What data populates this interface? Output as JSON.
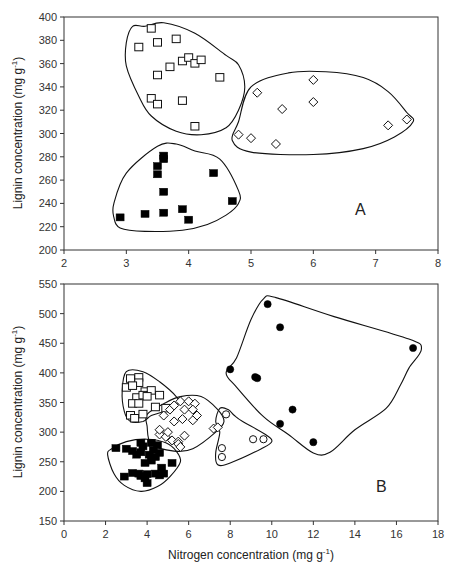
{
  "chart_data": [
    {
      "type": "scatter",
      "panel_label": "A",
      "title": "",
      "xlabel": "",
      "ylabel": "Lignin concentration (mg g",
      "ylabel_sup": "-1",
      "ylabel_suffix": ")",
      "xlim": [
        2,
        8
      ],
      "ylim": [
        200,
        400
      ],
      "xticks": [
        2,
        3,
        4,
        5,
        6,
        7,
        8
      ],
      "yticks": [
        200,
        220,
        240,
        260,
        280,
        300,
        320,
        340,
        360,
        380,
        400
      ],
      "grid": false,
      "legend": null,
      "series": [
        {
          "name": "open squares",
          "marker": "square-open",
          "points": [
            [
              3.2,
              374
            ],
            [
              3.4,
              390
            ],
            [
              3.5,
              378
            ],
            [
              3.8,
              381
            ],
            [
              3.7,
              357
            ],
            [
              3.9,
              362
            ],
            [
              4.0,
              365
            ],
            [
              4.1,
              360
            ],
            [
              4.2,
              363
            ],
            [
              3.5,
              350
            ],
            [
              4.5,
              348
            ],
            [
              3.4,
              330
            ],
            [
              3.5,
              325
            ],
            [
              3.9,
              328
            ],
            [
              4.1,
              306
            ]
          ],
          "hull": [
            [
              3.3,
              392
            ],
            [
              3.6,
              395
            ],
            [
              4.1,
              386
            ],
            [
              4.6,
              367
            ],
            [
              4.8,
              359
            ],
            [
              4.9,
              340
            ],
            [
              4.8,
              320
            ],
            [
              4.6,
              305
            ],
            [
              4.2,
              299
            ],
            [
              3.8,
              302
            ],
            [
              3.4,
              315
            ],
            [
              3.2,
              332
            ],
            [
              3.0,
              358
            ],
            [
              3.0,
              378
            ],
            [
              3.1,
              392
            ]
          ]
        },
        {
          "name": "open diamonds",
          "marker": "diamond-open",
          "points": [
            [
              5.1,
              335
            ],
            [
              6.0,
              346
            ],
            [
              6.0,
              327
            ],
            [
              5.5,
              321
            ],
            [
              4.8,
              299
            ],
            [
              5.0,
              296
            ],
            [
              5.4,
              291
            ],
            [
              7.2,
              307
            ],
            [
              7.5,
              312
            ]
          ],
          "hull": [
            [
              5.0,
              340
            ],
            [
              5.6,
              352
            ],
            [
              6.2,
              353
            ],
            [
              6.8,
              348
            ],
            [
              7.2,
              336
            ],
            [
              7.5,
              318
            ],
            [
              7.6,
              310
            ],
            [
              7.3,
              297
            ],
            [
              6.8,
              287
            ],
            [
              6.0,
              282
            ],
            [
              5.0,
              284
            ],
            [
              4.7,
              294
            ],
            [
              4.8,
              310
            ]
          ]
        },
        {
          "name": "filled squares",
          "marker": "square-filled",
          "points": [
            [
              2.9,
              228
            ],
            [
              3.3,
              231
            ],
            [
              3.6,
              281
            ],
            [
              3.6,
              278
            ],
            [
              3.5,
              272
            ],
            [
              3.5,
              265
            ],
            [
              3.6,
              250
            ],
            [
              3.6,
              232
            ],
            [
              3.9,
              235
            ],
            [
              4.0,
              226
            ],
            [
              4.4,
              266
            ],
            [
              4.7,
              242
            ]
          ],
          "hull": [
            [
              3.0,
              266
            ],
            [
              3.5,
              289
            ],
            [
              3.8,
              291
            ],
            [
              4.1,
              285
            ],
            [
              4.5,
              278
            ],
            [
              4.8,
              251
            ],
            [
              4.8,
              240
            ],
            [
              4.6,
              230
            ],
            [
              4.3,
              222
            ],
            [
              3.9,
              217
            ],
            [
              3.3,
              216
            ],
            [
              2.9,
              219
            ],
            [
              2.8,
              228
            ],
            [
              2.8,
              240
            ]
          ]
        }
      ],
      "annotations": [
        "A"
      ]
    },
    {
      "type": "scatter",
      "panel_label": "B",
      "title": "",
      "xlabel": "Nitrogen concentration (mg g",
      "xlabel_sup": "-1",
      "xlabel_suffix": ")",
      "ylabel": "Lignin concentration (mg g",
      "ylabel_sup": "-1",
      "ylabel_suffix": ")",
      "xlim": [
        0,
        18
      ],
      "ylim": [
        150,
        550
      ],
      "xticks": [
        0,
        2,
        4,
        6,
        8,
        10,
        12,
        14,
        16,
        18
      ],
      "yticks": [
        150,
        200,
        250,
        300,
        350,
        400,
        450,
        500,
        550
      ],
      "grid": false,
      "legend": null,
      "series": [
        {
          "name": "open squares",
          "marker": "square-open",
          "points": [
            [
              3.2,
              390
            ],
            [
              3.6,
              392
            ],
            [
              3.6,
              383
            ],
            [
              3.0,
              375
            ],
            [
              3.3,
              378
            ],
            [
              3.9,
              368
            ],
            [
              4.2,
              370
            ],
            [
              3.5,
              358
            ],
            [
              3.8,
              362
            ],
            [
              4.0,
              360
            ],
            [
              3.3,
              348
            ],
            [
              3.6,
              348
            ],
            [
              4.6,
              362
            ],
            [
              3.2,
              328
            ],
            [
              3.4,
              323
            ],
            [
              3.8,
              330
            ],
            [
              4.4,
              342
            ],
            [
              4.9,
              340
            ]
          ],
          "hull": [
            [
              3.0,
              402
            ],
            [
              3.8,
              402
            ],
            [
              4.6,
              385
            ],
            [
              5.4,
              360
            ],
            [
              5.5,
              348
            ],
            [
              4.8,
              335
            ],
            [
              4.2,
              328
            ],
            [
              3.8,
              318
            ],
            [
              3.2,
              318
            ],
            [
              2.9,
              335
            ],
            [
              2.8,
              370
            ]
          ]
        },
        {
          "name": "open diamonds",
          "marker": "diamond-open",
          "points": [
            [
              4.8,
              328
            ],
            [
              5.1,
              338
            ],
            [
              5.3,
              345
            ],
            [
              5.6,
              352
            ],
            [
              6.0,
              352
            ],
            [
              6.3,
              348
            ],
            [
              5.8,
              338
            ],
            [
              6.2,
              338
            ],
            [
              5.3,
              318
            ],
            [
              5.7,
              322
            ],
            [
              6.2,
              320
            ],
            [
              6.4,
              328
            ],
            [
              4.6,
              296
            ],
            [
              4.9,
              292
            ],
            [
              5.2,
              286
            ],
            [
              5.5,
              284
            ],
            [
              5.0,
              300
            ],
            [
              4.6,
              304
            ],
            [
              5.8,
              294
            ],
            [
              5.5,
              280
            ],
            [
              5.6,
              275
            ],
            [
              7.2,
              306
            ],
            [
              7.4,
              308
            ]
          ],
          "hull": [
            [
              4.0,
              330
            ],
            [
              4.8,
              348
            ],
            [
              5.6,
              360
            ],
            [
              6.6,
              360
            ],
            [
              7.4,
              338
            ],
            [
              7.7,
              318
            ],
            [
              7.3,
              300
            ],
            [
              6.2,
              272
            ],
            [
              5.3,
              268
            ],
            [
              4.2,
              280
            ],
            [
              4.0,
              310
            ]
          ]
        },
        {
          "name": "open circles",
          "marker": "circle-open",
          "points": [
            [
              7.8,
              330
            ],
            [
              7.6,
              273
            ],
            [
              7.6,
              258
            ],
            [
              9.1,
              288
            ],
            [
              9.6,
              288
            ]
          ],
          "hull": [
            [
              7.5,
              340
            ],
            [
              7.9,
              338
            ],
            [
              8.2,
              328
            ],
            [
              8.6,
              318
            ],
            [
              9.7,
              296
            ],
            [
              10.0,
              284
            ],
            [
              9.5,
              272
            ],
            [
              8.0,
              248
            ],
            [
              7.4,
              245
            ],
            [
              7.3,
              265
            ],
            [
              7.5,
              300
            ],
            [
              7.3,
              318
            ]
          ]
        },
        {
          "name": "filled squares",
          "marker": "square-filled",
          "points": [
            [
              2.5,
              273
            ],
            [
              3.0,
              272
            ],
            [
              3.3,
              268
            ],
            [
              3.5,
              262
            ],
            [
              3.7,
              282
            ],
            [
              3.8,
              276
            ],
            [
              3.7,
              266
            ],
            [
              4.1,
              262
            ],
            [
              4.3,
              270
            ],
            [
              4.4,
              258
            ],
            [
              4.2,
              252
            ],
            [
              3.9,
              248
            ],
            [
              4.6,
              265
            ],
            [
              4.5,
              278
            ],
            [
              4.2,
              282
            ],
            [
              5.2,
              248
            ],
            [
              4.7,
              240
            ],
            [
              3.6,
              230
            ],
            [
              3.3,
              231
            ],
            [
              2.9,
              225
            ],
            [
              3.7,
              226
            ],
            [
              4.0,
              229
            ],
            [
              3.9,
              222
            ],
            [
              4.0,
              214
            ],
            [
              4.4,
              230
            ],
            [
              4.8,
              230
            ],
            [
              4.6,
              227
            ]
          ],
          "hull": [
            [
              2.3,
              272
            ],
            [
              3.0,
              284
            ],
            [
              4.0,
              288
            ],
            [
              4.9,
              282
            ],
            [
              5.4,
              268
            ],
            [
              5.6,
              250
            ],
            [
              5.1,
              225
            ],
            [
              4.5,
              208
            ],
            [
              3.7,
              200
            ],
            [
              2.9,
              210
            ],
            [
              2.4,
              230
            ],
            [
              2.1,
              262
            ]
          ]
        },
        {
          "name": "filled circles",
          "marker": "circle-filled",
          "points": [
            [
              9.8,
              516
            ],
            [
              10.4,
              477
            ],
            [
              16.8,
              442
            ],
            [
              8.0,
              406
            ],
            [
              9.2,
              393
            ],
            [
              9.3,
              391
            ],
            [
              11.0,
              338
            ],
            [
              10.4,
              314
            ],
            [
              12.0,
              283
            ]
          ],
          "hull": [
            [
              9.6,
              525
            ],
            [
              10.2,
              527
            ],
            [
              13.0,
              495
            ],
            [
              16.6,
              457
            ],
            [
              17.2,
              440
            ],
            [
              16.6,
              408
            ],
            [
              16.2,
              380
            ],
            [
              15.5,
              340
            ],
            [
              14.0,
              304
            ],
            [
              12.8,
              266
            ],
            [
              12.0,
              265
            ],
            [
              10.8,
              296
            ],
            [
              9.6,
              326
            ],
            [
              8.3,
              376
            ],
            [
              7.8,
              400
            ],
            [
              8.3,
              425
            ],
            [
              9.0,
              490
            ]
          ]
        }
      ],
      "annotations": [
        "B"
      ]
    }
  ],
  "panels": [
    {
      "label": "A"
    },
    {
      "label": "B"
    }
  ]
}
